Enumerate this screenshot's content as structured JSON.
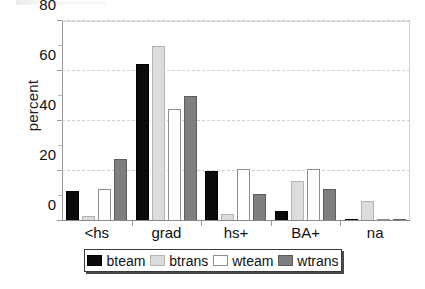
{
  "chart_data": {
    "type": "bar",
    "title": "",
    "xlabel": "",
    "ylabel": "percent",
    "ylim": [
      0,
      80
    ],
    "yticks": [
      0,
      20,
      40,
      60,
      80
    ],
    "grid": true,
    "legend_position": "bottom",
    "categories": [
      "<hs",
      "grad",
      "hs+",
      "BA+",
      "na"
    ],
    "series": [
      {
        "name": "bteam",
        "color": "#0b0b0b",
        "values": [
          12,
          63,
          20,
          4,
          0
        ]
      },
      {
        "name": "btrans",
        "color": "#dcdcdc",
        "values": [
          2,
          70,
          3,
          16,
          8
        ]
      },
      {
        "name": "wteam",
        "color": "#ffffff",
        "values": [
          13,
          45,
          21,
          21,
          0
        ]
      },
      {
        "name": "wtrans",
        "color": "#7f7f7f",
        "values": [
          25,
          50,
          11,
          13,
          1
        ]
      }
    ]
  },
  "axes": {
    "y_title": "percent",
    "y_tick_labels": [
      "80",
      "60",
      "40",
      "20",
      "0"
    ],
    "x_tick_labels": [
      "<hs",
      "grad",
      "hs+",
      "BA+",
      "na"
    ]
  },
  "legend": {
    "items": [
      {
        "label": "bteam",
        "swatch": "black-swatch"
      },
      {
        "label": "btrans",
        "swatch": "light-gray-swatch"
      },
      {
        "label": "wteam",
        "swatch": "white-swatch"
      },
      {
        "label": "wtrans",
        "swatch": "dark-gray-swatch"
      }
    ]
  }
}
